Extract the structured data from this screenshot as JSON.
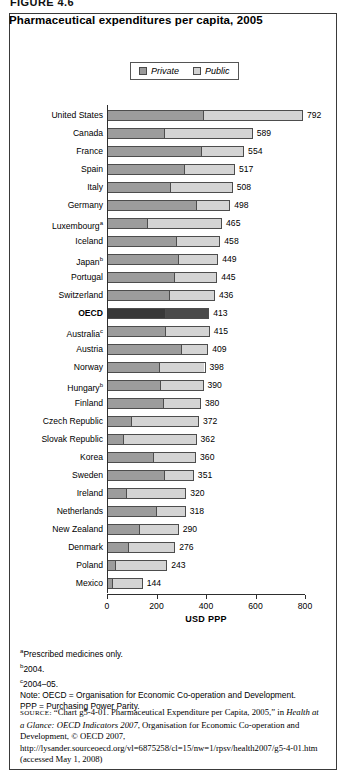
{
  "figure": {
    "label": "FIGURE 4.6",
    "title": "Pharmaceutical expenditures per capita, 2005"
  },
  "legend": {
    "position": "top-center",
    "entries": [
      {
        "label": "Private",
        "swatch": "private-swatch",
        "color": "#9c9c9c"
      },
      {
        "label": "Public",
        "swatch": "public-swatch",
        "color": "#d4d4d4"
      }
    ]
  },
  "chart_data": {
    "type": "bar",
    "orientation": "horizontal",
    "stacked": true,
    "title": "Pharmaceutical expenditures per capita, 2005",
    "xlabel": "USD PPP",
    "ylabel": "",
    "xlim": [
      0,
      800
    ],
    "xticks": [
      0,
      200,
      400,
      600,
      800
    ],
    "grid": false,
    "legend": [
      "Private",
      "Public"
    ],
    "categories": [
      "United States",
      "Canada",
      "France",
      "Spain",
      "Italy",
      "Germany",
      "Luxembourg",
      "Iceland",
      "Japan",
      "Portugal",
      "Switzerland",
      "OECD",
      "Australia",
      "Austria",
      "Norway",
      "Hungary",
      "Finland",
      "Czech Republic",
      "Slovak Republic",
      "Korea",
      "Sweden",
      "Ireland",
      "Netherlands",
      "New Zealand",
      "Denmark",
      "Poland",
      "Mexico"
    ],
    "category_footnotes": {
      "Luxembourg": "a",
      "Japan": "b",
      "Australia": "c",
      "Hungary": "b"
    },
    "highlighted_category": "OECD",
    "totals": [
      792,
      589,
      554,
      517,
      508,
      498,
      465,
      458,
      449,
      445,
      436,
      413,
      415,
      409,
      398,
      390,
      380,
      372,
      362,
      360,
      351,
      320,
      318,
      290,
      276,
      243,
      144
    ],
    "series": [
      {
        "name": "Private",
        "values": [
          388,
          230,
          380,
          310,
          256,
          360,
          160,
          280,
          290,
          270,
          250,
          235,
          235,
          300,
          210,
          215,
          225,
          95,
          62,
          185,
          230,
          75,
          200,
          130,
          82,
          30,
          18
        ]
      },
      {
        "name": "Public",
        "values": [
          404,
          359,
          174,
          207,
          252,
          138,
          305,
          178,
          159,
          175,
          186,
          178,
          180,
          109,
          188,
          175,
          155,
          277,
          300,
          175,
          121,
          245,
          118,
          160,
          194,
          213,
          126
        ]
      }
    ],
    "data_labels": [
      "792",
      "589",
      "554",
      "517",
      "508",
      "498",
      "465",
      "458",
      "449",
      "445",
      "436",
      "413",
      "415",
      "409",
      "398",
      "390",
      "380",
      "372",
      "362",
      "360",
      "351",
      "320",
      "318",
      "290",
      "276",
      "243",
      "144"
    ]
  },
  "notes": {
    "a": "Prescribed medicines only.",
    "b": "2004.",
    "c": "2004–05.",
    "note_oecd": "Note: OECD = Organisation for Economic Co-operation and Development.",
    "note_ppp": "PPP = Purchasing Power Parity."
  },
  "source": {
    "prefix": "SOURCE:",
    "part1": " “Chart g5-4-01. Pharmaceutical Expenditure per Capita, 2005,” in ",
    "italic": "Health at a Glance: OECD Indicators 2007",
    "part2": ", Organisation for Economic Co-operation and Development, © OECD 2007, http://lysander.sourceoecd.org/vl=6875258/cl=15/nw=1/rpsv/health2007/g5-4-01.htm (accessed May 1, 2008)"
  }
}
